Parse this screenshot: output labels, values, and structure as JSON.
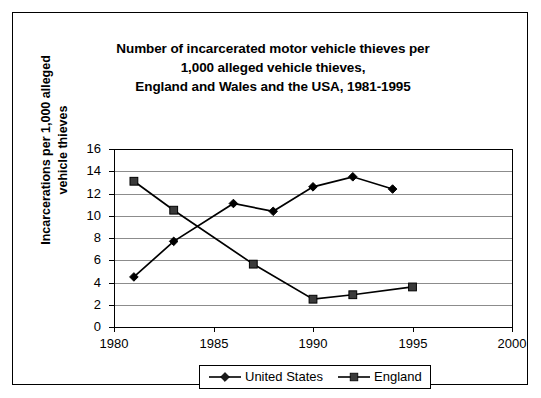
{
  "chart_data": {
    "type": "line",
    "title": "Number of incarcerated motor vehicle thieves per 1,000 alleged vehicle thieves, England and Wales and the USA, 1981-1995",
    "title_lines": [
      "Number of incarcerated motor vehicle thieves per",
      "1,000 alleged vehicle thieves,",
      "England and Wales and the USA, 1981-1995"
    ],
    "xlabel": "",
    "ylabel": "Incarcerations per 1,000 alleged vehicle thieves",
    "ylabel_lines": [
      "Incarcerations per 1,000 alleged",
      "vehicle thieves"
    ],
    "xlim": [
      1980,
      2000
    ],
    "ylim": [
      0,
      16
    ],
    "xticks": [
      1980,
      1985,
      1990,
      1995,
      2000
    ],
    "xtick_labels": [
      "1980",
      "1985",
      "1990",
      "1995",
      "2000"
    ],
    "yticks": [
      0,
      2,
      4,
      6,
      8,
      10,
      12,
      14,
      16
    ],
    "ytick_labels": [
      "0",
      "2",
      "4",
      "6",
      "8",
      "10",
      "12",
      "14",
      "16"
    ],
    "grid": "horizontal",
    "legend_position": "bottom-center",
    "series": [
      {
        "name": "United States",
        "marker": "diamond",
        "color": "#000000",
        "x": [
          1981,
          1983,
          1986,
          1988,
          1990,
          1992,
          1994
        ],
        "values": [
          4.5,
          7.7,
          11.1,
          10.4,
          12.6,
          13.5,
          12.4
        ]
      },
      {
        "name": "England",
        "marker": "square",
        "color": "#3a3a3a",
        "x": [
          1981,
          1983,
          1987,
          1990,
          1992,
          1995
        ],
        "values": [
          13.1,
          10.5,
          5.65,
          2.5,
          2.9,
          3.6
        ]
      }
    ]
  },
  "legend": {
    "entries": [
      {
        "label": "United States",
        "marker": "diamond"
      },
      {
        "label": "England",
        "marker": "square"
      }
    ]
  }
}
